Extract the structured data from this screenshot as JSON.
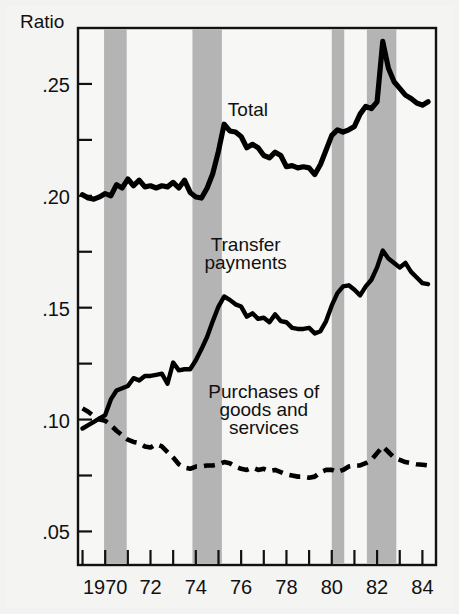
{
  "chart_data": {
    "type": "line",
    "title": "",
    "ylabel": "Ratio",
    "xlabel": "",
    "ylim": [
      0.035,
      0.275
    ],
    "xlim": [
      1968.8,
      1984.6
    ],
    "grid": false,
    "legend_position": "inline-annotations",
    "y_axis": {
      "label": "Ratio",
      "major_ticks": [
        0.05,
        0.1,
        0.15,
        0.2,
        0.25
      ],
      "major_tick_labels": [
        ".05",
        ".10",
        ".15",
        ".20",
        ".25"
      ],
      "minor_ticks": [
        0.075,
        0.125,
        0.175,
        0.225
      ]
    },
    "x_axis": {
      "ticks": [
        1969,
        1970,
        1971,
        1972,
        1973,
        1974,
        1975,
        1976,
        1977,
        1978,
        1979,
        1980,
        1981,
        1982,
        1983,
        1984
      ],
      "tick_labels": [
        "",
        "1970",
        "",
        "72",
        "",
        "74",
        "",
        "76",
        "",
        "78",
        "",
        "80",
        "",
        "82",
        "",
        "84"
      ],
      "labeled_ticks": [
        {
          "x": 1970,
          "label": "1970"
        },
        {
          "x": 1972,
          "label": "72"
        },
        {
          "x": 1974,
          "label": "74"
        },
        {
          "x": 1976,
          "label": "76"
        },
        {
          "x": 1978,
          "label": "78"
        },
        {
          "x": 1980,
          "label": "80"
        },
        {
          "x": 1982,
          "label": "82"
        },
        {
          "x": 1984,
          "label": "84"
        }
      ]
    },
    "recession_bands": [
      {
        "start": 1969.95,
        "end": 1970.95,
        "color": "#b4b4b4"
      },
      {
        "start": 1973.85,
        "end": 1975.15,
        "color": "#b4b4b4"
      },
      {
        "start": 1980.0,
        "end": 1980.55,
        "color": "#b4b4b4"
      },
      {
        "start": 1981.55,
        "end": 1982.85,
        "color": "#b4b4b4"
      }
    ],
    "annotations": [
      {
        "text": "Total",
        "x": 1976.3,
        "y": 0.2355
      },
      {
        "text": "Transfer",
        "x": 1976.2,
        "y": 0.1755
      },
      {
        "text": "payments",
        "x": 1976.2,
        "y": 0.1675
      },
      {
        "text": "Purchases of",
        "x": 1977.0,
        "y": 0.1095
      },
      {
        "text": "goods and",
        "x": 1977.0,
        "y": 0.1015
      },
      {
        "text": "services",
        "x": 1977.0,
        "y": 0.0935
      }
    ],
    "series": [
      {
        "name": "Total",
        "style": "solid",
        "linewidth": "thick",
        "color": "#000000",
        "x": [
          1969.0,
          1969.25,
          1969.5,
          1969.75,
          1970.0,
          1970.25,
          1970.5,
          1970.75,
          1971.0,
          1971.25,
          1971.5,
          1971.75,
          1972.0,
          1972.25,
          1972.5,
          1972.75,
          1973.0,
          1973.25,
          1973.5,
          1973.75,
          1974.0,
          1974.25,
          1974.5,
          1974.75,
          1975.0,
          1975.25,
          1975.5,
          1975.75,
          1976.0,
          1976.25,
          1976.5,
          1976.75,
          1977.0,
          1977.25,
          1977.5,
          1977.75,
          1978.0,
          1978.25,
          1978.5,
          1978.75,
          1979.0,
          1979.25,
          1979.5,
          1979.75,
          1980.0,
          1980.25,
          1980.5,
          1980.75,
          1981.0,
          1981.25,
          1981.5,
          1981.75,
          1982.0,
          1982.25,
          1982.5,
          1982.75,
          1983.0,
          1983.25,
          1983.5,
          1983.75,
          1984.0,
          1984.25
        ],
        "y": [
          0.2005,
          0.199,
          0.1985,
          0.1995,
          0.201,
          0.2,
          0.205,
          0.2035,
          0.2075,
          0.2045,
          0.207,
          0.204,
          0.2045,
          0.2035,
          0.2045,
          0.204,
          0.206,
          0.2035,
          0.207,
          0.2015,
          0.1995,
          0.199,
          0.2035,
          0.21,
          0.22,
          0.232,
          0.229,
          0.2285,
          0.2265,
          0.2215,
          0.223,
          0.2215,
          0.218,
          0.217,
          0.2195,
          0.218,
          0.213,
          0.2135,
          0.2125,
          0.213,
          0.2125,
          0.2095,
          0.214,
          0.2205,
          0.227,
          0.2295,
          0.2285,
          0.2295,
          0.231,
          0.2365,
          0.24,
          0.239,
          0.242,
          0.269,
          0.257,
          0.251,
          0.248,
          0.245,
          0.2435,
          0.2415,
          0.2405,
          0.242
        ]
      },
      {
        "name": "Transfer payments",
        "style": "solid",
        "linewidth": "medium",
        "color": "#000000",
        "x": [
          1969.0,
          1969.25,
          1969.5,
          1969.75,
          1970.0,
          1970.25,
          1970.5,
          1970.75,
          1971.0,
          1971.25,
          1971.5,
          1971.75,
          1972.0,
          1972.25,
          1972.5,
          1972.75,
          1973.0,
          1973.25,
          1973.5,
          1973.75,
          1974.0,
          1974.25,
          1974.5,
          1974.75,
          1975.0,
          1975.25,
          1975.5,
          1975.75,
          1976.0,
          1976.25,
          1976.5,
          1976.75,
          1977.0,
          1977.25,
          1977.5,
          1977.75,
          1978.0,
          1978.25,
          1978.5,
          1978.75,
          1979.0,
          1979.25,
          1979.5,
          1979.75,
          1980.0,
          1980.25,
          1980.5,
          1980.75,
          1981.0,
          1981.25,
          1981.5,
          1981.75,
          1982.0,
          1982.25,
          1982.5,
          1982.75,
          1983.0,
          1983.25,
          1983.5,
          1983.75,
          1984.0,
          1984.25
        ],
        "y": [
          0.096,
          0.0975,
          0.099,
          0.1005,
          0.102,
          0.109,
          0.113,
          0.114,
          0.115,
          0.1185,
          0.1175,
          0.1195,
          0.1195,
          0.12,
          0.1205,
          0.116,
          0.1255,
          0.122,
          0.1225,
          0.1225,
          0.1265,
          0.1315,
          0.137,
          0.144,
          0.1505,
          0.155,
          0.1535,
          0.1515,
          0.1505,
          0.146,
          0.1475,
          0.145,
          0.1455,
          0.1435,
          0.147,
          0.144,
          0.1435,
          0.141,
          0.1405,
          0.1405,
          0.141,
          0.1385,
          0.1395,
          0.144,
          0.151,
          0.1565,
          0.1595,
          0.16,
          0.158,
          0.1555,
          0.1595,
          0.1625,
          0.168,
          0.1755,
          0.172,
          0.17,
          0.168,
          0.17,
          0.166,
          0.1635,
          0.161,
          0.1605
        ]
      },
      {
        "name": "Purchases of goods and services",
        "style": "dashed",
        "linewidth": "medium",
        "color": "#000000",
        "x": [
          1969.0,
          1969.25,
          1969.5,
          1969.75,
          1970.0,
          1970.25,
          1970.5,
          1970.75,
          1971.0,
          1971.25,
          1971.5,
          1971.75,
          1972.0,
          1972.25,
          1972.5,
          1972.75,
          1973.0,
          1973.25,
          1973.5,
          1973.75,
          1974.0,
          1974.25,
          1974.5,
          1974.75,
          1975.0,
          1975.25,
          1975.5,
          1975.75,
          1976.0,
          1976.25,
          1976.5,
          1976.75,
          1977.0,
          1977.25,
          1977.5,
          1977.75,
          1978.0,
          1978.25,
          1978.5,
          1978.75,
          1979.0,
          1979.25,
          1979.5,
          1979.75,
          1980.0,
          1980.25,
          1980.5,
          1980.75,
          1981.0,
          1981.25,
          1981.5,
          1981.75,
          1982.0,
          1982.25,
          1982.5,
          1982.75,
          1983.0,
          1983.25,
          1983.5,
          1983.75,
          1984.0,
          1984.25
        ],
        "y": [
          0.105,
          0.1035,
          0.1015,
          0.1,
          0.0995,
          0.0975,
          0.095,
          0.093,
          0.091,
          0.09,
          0.0895,
          0.088,
          0.0875,
          0.089,
          0.088,
          0.0855,
          0.083,
          0.08,
          0.0785,
          0.078,
          0.079,
          0.079,
          0.0795,
          0.0795,
          0.08,
          0.081,
          0.0805,
          0.079,
          0.078,
          0.0775,
          0.0785,
          0.0775,
          0.078,
          0.077,
          0.0775,
          0.0765,
          0.0755,
          0.075,
          0.0745,
          0.0745,
          0.074,
          0.0745,
          0.0765,
          0.0775,
          0.0775,
          0.0765,
          0.0775,
          0.079,
          0.0795,
          0.0795,
          0.0805,
          0.082,
          0.085,
          0.088,
          0.0855,
          0.083,
          0.082,
          0.081,
          0.0805,
          0.08,
          0.0798,
          0.0795
        ]
      }
    ]
  },
  "colors": {
    "background": "#f2f2f0",
    "plot_background": "#f7f7f5",
    "axis": "#111111",
    "series": "#000000",
    "recession_band": "#b4b4b4"
  }
}
